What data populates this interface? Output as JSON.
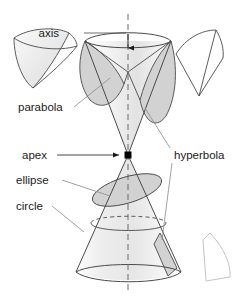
{
  "figure": {
    "background_color": "#ffffff",
    "stroke_color": "#3a3a3a",
    "shade_fill": "#d5d5d5",
    "light_outline_color": "#c8c8c8",
    "apex_marker_color": "#000000",
    "axis_style": "dashed"
  },
  "labels": {
    "axis": "axis",
    "parabola": "parabola",
    "apex": "apex",
    "ellipse": "ellipse",
    "circle": "circle",
    "hyperbola": "hyperbola"
  },
  "shapes": {
    "upper_nappe": "upper-cone-nappe",
    "lower_nappe": "lower-cone-nappe",
    "apex_point": "apex-marker",
    "axis_line": "vertical-axis",
    "parabola_region": "shaded-parabola-section",
    "hyperbola_region_upper": "shaded-hyperbola-section-upper",
    "hyperbola_region_lower": "shaded-hyperbola-section-lower",
    "ellipse_region": "shaded-ellipse-section",
    "circle_section": "circle-cross-section",
    "inset_parabola": "detached-parabola-piece",
    "inset_hyperbola_top": "detached-hyperbola-piece-top",
    "inset_hyperbola_bottom": "detached-hyperbola-piece-bottom"
  }
}
